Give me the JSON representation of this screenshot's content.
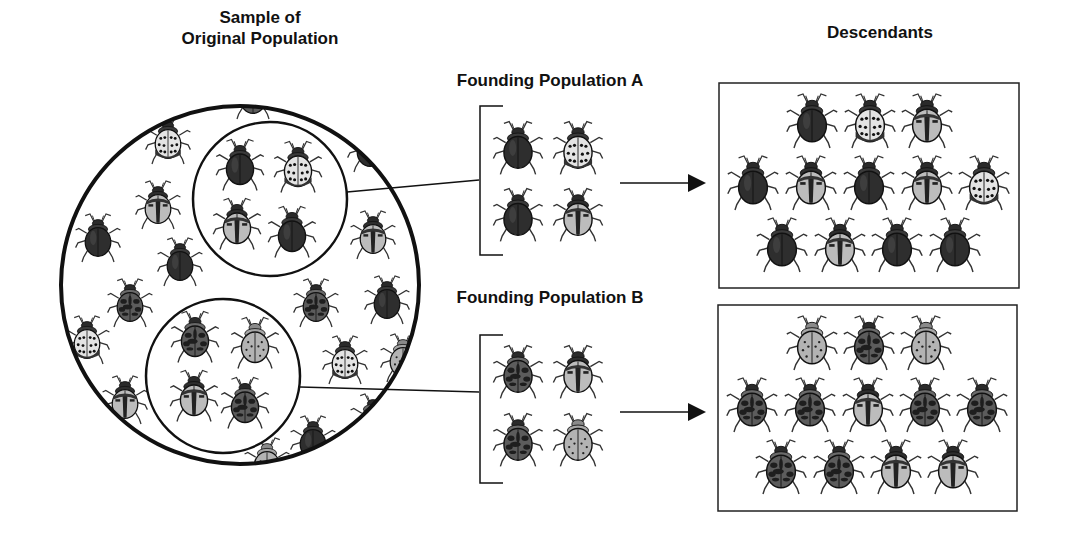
{
  "labels": {
    "sample": "Sample of\nOriginal Population",
    "sample_line1": "Sample of",
    "sample_line2": "Original Population",
    "founding_a": "Founding Population A",
    "founding_b": "Founding Population B",
    "descendants": "Descendants"
  },
  "beetle_types": {
    "dark": {
      "body": "#2e2e2e",
      "desc": "solid dark beetle"
    },
    "whitespot": {
      "body": "#e6e6e6",
      "desc": "white beetle with black spots"
    },
    "stripe": {
      "body": "#bdbdbd",
      "desc": "light beetle with dark center stripe"
    },
    "mottled": {
      "body": "#5a5a5a",
      "desc": "dark mottled beetle"
    },
    "lightspot": {
      "body": "#b5b5b5",
      "desc": "light grey beetle with small dots"
    }
  },
  "original_population_background": [
    {
      "x": 253,
      "y": 95,
      "t": "mottled",
      "s": 0.8
    },
    {
      "x": 168,
      "y": 140,
      "t": "whitespot",
      "s": 0.8
    },
    {
      "x": 370,
      "y": 148,
      "t": "dark",
      "s": 0.8
    },
    {
      "x": 158,
      "y": 205,
      "t": "stripe",
      "s": 0.8
    },
    {
      "x": 98,
      "y": 238,
      "t": "dark",
      "s": 0.8
    },
    {
      "x": 180,
      "y": 262,
      "t": "dark",
      "s": 0.8
    },
    {
      "x": 373,
      "y": 235,
      "t": "stripe",
      "s": 0.8
    },
    {
      "x": 130,
      "y": 303,
      "t": "mottled",
      "s": 0.8
    },
    {
      "x": 316,
      "y": 303,
      "t": "mottled",
      "s": 0.8
    },
    {
      "x": 387,
      "y": 300,
      "t": "dark",
      "s": 0.8
    },
    {
      "x": 87,
      "y": 340,
      "t": "whitespot",
      "s": 0.8
    },
    {
      "x": 345,
      "y": 360,
      "t": "whitespot",
      "s": 0.8
    },
    {
      "x": 403,
      "y": 358,
      "t": "lightspot",
      "s": 0.8
    },
    {
      "x": 125,
      "y": 400,
      "t": "stripe",
      "s": 0.8
    },
    {
      "x": 313,
      "y": 440,
      "t": "dark",
      "s": 0.8
    },
    {
      "x": 267,
      "y": 462,
      "t": "lightspot",
      "s": 0.8
    },
    {
      "x": 373,
      "y": 418,
      "t": "mottled",
      "s": 0.8
    }
  ],
  "sample_a": [
    {
      "x": 240,
      "y": 165,
      "t": "dark"
    },
    {
      "x": 298,
      "y": 167,
      "t": "whitespot"
    },
    {
      "x": 237,
      "y": 224,
      "t": "stripe"
    },
    {
      "x": 292,
      "y": 232,
      "t": "dark"
    }
  ],
  "sample_b": [
    {
      "x": 195,
      "y": 337,
      "t": "mottled"
    },
    {
      "x": 255,
      "y": 343,
      "t": "lightspot"
    },
    {
      "x": 194,
      "y": 396,
      "t": "stripe"
    },
    {
      "x": 245,
      "y": 403,
      "t": "mottled"
    }
  ],
  "founding_a": [
    {
      "x": 518,
      "y": 148,
      "t": "dark"
    },
    {
      "x": 578,
      "y": 148,
      "t": "whitespot"
    },
    {
      "x": 518,
      "y": 215,
      "t": "dark"
    },
    {
      "x": 578,
      "y": 215,
      "t": "stripe"
    }
  ],
  "founding_b": [
    {
      "x": 518,
      "y": 372,
      "t": "mottled"
    },
    {
      "x": 578,
      "y": 372,
      "t": "stripe"
    },
    {
      "x": 518,
      "y": 440,
      "t": "mottled"
    },
    {
      "x": 578,
      "y": 440,
      "t": "lightspot"
    }
  ],
  "descendants_a": [
    {
      "x": 812,
      "y": 121,
      "t": "dark"
    },
    {
      "x": 870,
      "y": 121,
      "t": "whitespot"
    },
    {
      "x": 927,
      "y": 121,
      "t": "stripe"
    },
    {
      "x": 753,
      "y": 183,
      "t": "dark"
    },
    {
      "x": 811,
      "y": 183,
      "t": "stripe"
    },
    {
      "x": 869,
      "y": 183,
      "t": "dark"
    },
    {
      "x": 927,
      "y": 183,
      "t": "stripe"
    },
    {
      "x": 984,
      "y": 183,
      "t": "whitespot"
    },
    {
      "x": 782,
      "y": 245,
      "t": "dark"
    },
    {
      "x": 840,
      "y": 245,
      "t": "stripe"
    },
    {
      "x": 897,
      "y": 245,
      "t": "dark"
    },
    {
      "x": 955,
      "y": 245,
      "t": "dark"
    }
  ],
  "descendants_b": [
    {
      "x": 812,
      "y": 343,
      "t": "lightspot"
    },
    {
      "x": 869,
      "y": 343,
      "t": "mottled"
    },
    {
      "x": 926,
      "y": 343,
      "t": "lightspot"
    },
    {
      "x": 752,
      "y": 405,
      "t": "mottled"
    },
    {
      "x": 810,
      "y": 405,
      "t": "mottled"
    },
    {
      "x": 868,
      "y": 405,
      "t": "stripe"
    },
    {
      "x": 925,
      "y": 405,
      "t": "mottled"
    },
    {
      "x": 982,
      "y": 405,
      "t": "mottled"
    },
    {
      "x": 781,
      "y": 467,
      "t": "mottled"
    },
    {
      "x": 839,
      "y": 467,
      "t": "mottled"
    },
    {
      "x": 896,
      "y": 467,
      "t": "stripe"
    },
    {
      "x": 953,
      "y": 467,
      "t": "stripe"
    }
  ],
  "counts": {
    "founding_a": 4,
    "founding_b": 4,
    "descendants_a": 12,
    "descendants_b": 12
  }
}
